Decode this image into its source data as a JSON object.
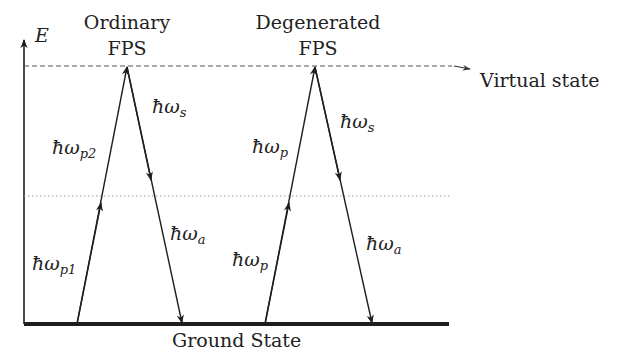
{
  "axis": {
    "label": "E"
  },
  "levels": {
    "virtual": {
      "label": "Virtual state"
    },
    "ground": {
      "label": "Ground State"
    }
  },
  "processes": [
    {
      "title_line1": "Ordinary",
      "title_line2": "FPS",
      "pump1": {
        "base": "ħω",
        "sub": "p1"
      },
      "pump2": {
        "base": "ħω",
        "sub": "p2"
      },
      "signal": {
        "base": "ħω",
        "sub": "s"
      },
      "idler": {
        "base": "ħω",
        "sub": "a"
      }
    },
    {
      "title_line1": "Degenerated",
      "title_line2": "FPS",
      "pump1": {
        "base": "ħω",
        "sub": "p"
      },
      "pump2": {
        "base": "ħω",
        "sub": "p"
      },
      "signal": {
        "base": "ħω",
        "sub": "s"
      },
      "idler": {
        "base": "ħω",
        "sub": "a"
      }
    }
  ],
  "colors": {
    "line": "#1e1e1e",
    "dashed": "#555555",
    "dotted": "#9a9a9a"
  }
}
